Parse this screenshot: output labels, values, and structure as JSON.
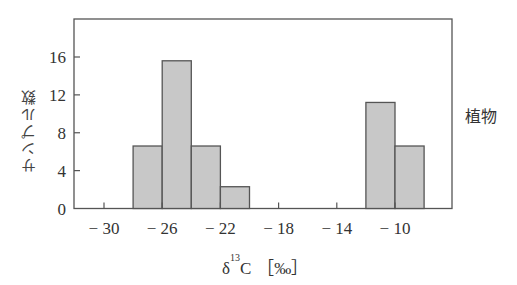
{
  "chart_data": {
    "type": "bar",
    "subtype": "histogram",
    "title": "",
    "xlabel_parts": {
      "delta": "δ",
      "superscript": "13",
      "element": "C",
      "unit": "［‰］"
    },
    "ylabel": "サンプル数",
    "annotation": "植物",
    "bin_width": 2,
    "bins": [
      {
        "from": -28,
        "to": -26,
        "value": 6.6
      },
      {
        "from": -26,
        "to": -24,
        "value": 15.6
      },
      {
        "from": -24,
        "to": -22,
        "value": 6.6
      },
      {
        "from": -22,
        "to": -20,
        "value": 2.3
      },
      {
        "from": -12,
        "to": -10,
        "value": 11.2
      },
      {
        "from": -10,
        "to": -8,
        "value": 6.6
      }
    ],
    "xlim": [
      -32,
      -6
    ],
    "ylim": [
      0,
      20
    ],
    "xticks": [
      -30,
      -26,
      -22,
      -18,
      -14,
      -10
    ],
    "xtick_labels": [
      "− 30",
      "− 26",
      "− 22",
      "− 18",
      "− 14",
      "− 10"
    ],
    "xticks_minor": [
      -28,
      -24,
      -20,
      -16,
      -12
    ],
    "yticks": [
      0,
      4,
      8,
      12,
      16
    ],
    "ytick_labels": [
      "0",
      "4",
      "8",
      "12",
      "16"
    ],
    "grid": false,
    "legend": "none",
    "colors": {
      "bar_fill": "#c8c8c8",
      "bar_stroke": "#555555",
      "axis": "#555555"
    }
  }
}
